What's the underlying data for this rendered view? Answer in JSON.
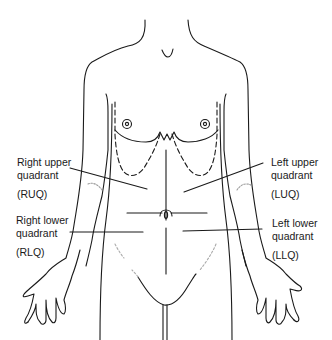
{
  "diagram": {
    "type": "anatomical-illustration",
    "quadrants": [
      {
        "id": "ruq",
        "name": "Right upper quadrant",
        "line1": "Right upper",
        "line2": "quadrant",
        "abbr": "(RUQ)"
      },
      {
        "id": "luq",
        "name": "Left upper quadrant",
        "line1": "Left upper",
        "line2": "quadrant",
        "abbr": "(LUQ)"
      },
      {
        "id": "rlq",
        "name": "Right lower quadrant",
        "line1": "Right lower",
        "line2": "quadrant",
        "abbr": "(RLQ)"
      },
      {
        "id": "llq",
        "name": "Left lower quadrant",
        "line1": "Left lower",
        "line2": "quadrant",
        "abbr": "(LLQ)"
      }
    ],
    "colors": {
      "line": "#1a1a1a",
      "faint": "#9a9a9a",
      "background": "#ffffff"
    }
  }
}
